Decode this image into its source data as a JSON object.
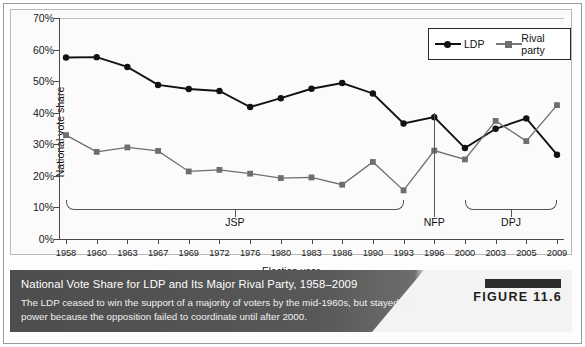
{
  "figure": {
    "badge_label": "FIGURE 11.6",
    "caption_title": "National Vote Share for LDP and Its Major Rival Party, 1958–2009",
    "caption_body": "The LDP ceased to win the support of a majority of voters by the mid-1960s, but stayed in power because the opposition failed to coordinate until after 2000.",
    "accent_dark": "#4d4d4d",
    "accent_light": "#f3f3f3",
    "badge_bar_color": "#2d2d2d"
  },
  "legend": {
    "position": "top-right",
    "items": [
      {
        "label": "LDP",
        "marker": "circle",
        "color": "#121212"
      },
      {
        "label": "Rival party",
        "marker": "square",
        "color": "#6e6e6e"
      }
    ]
  },
  "annotations": [
    {
      "name": "jsp",
      "label": "JSP",
      "type": "bracket",
      "start_year": "1958",
      "end_year": "1993"
    },
    {
      "name": "nfp",
      "label": "NFP",
      "type": "vline",
      "year": "1996"
    },
    {
      "name": "dpj",
      "label": "DPJ",
      "type": "bracket",
      "start_year": "2000",
      "end_year": "2009"
    }
  ],
  "chart_data": {
    "type": "line",
    "title": "National Vote Share for LDP and Its Major Rival Party, 1958–2009",
    "xlabel": "Election year",
    "ylabel": "National vote share",
    "ylim": [
      0,
      70
    ],
    "ytick_labels": [
      "0%",
      "10%",
      "20%",
      "30%",
      "40%",
      "50%",
      "60%",
      "70%"
    ],
    "ytick_values": [
      0,
      10,
      20,
      30,
      40,
      50,
      60,
      70
    ],
    "grid": false,
    "categories": [
      "1958",
      "1960",
      "1963",
      "1967",
      "1969",
      "1972",
      "1976",
      "1980",
      "1983",
      "1986",
      "1990",
      "1993",
      "1996",
      "2000",
      "2003",
      "2005",
      "2009"
    ],
    "series": [
      {
        "name": "LDP",
        "marker": "circle",
        "color": "#121212",
        "values": [
          57.5,
          57.6,
          54.5,
          48.8,
          47.5,
          46.9,
          41.8,
          44.6,
          47.6,
          49.4,
          46.1,
          36.6,
          38.6,
          28.8,
          34.9,
          38.2,
          26.7
        ]
      },
      {
        "name": "Rival party",
        "marker": "square",
        "color": "#6e6e6e",
        "values": [
          32.9,
          27.6,
          29.0,
          27.9,
          21.4,
          21.9,
          20.7,
          19.3,
          19.5,
          17.2,
          24.4,
          15.4,
          28.0,
          25.2,
          37.4,
          31.0,
          42.4
        ]
      }
    ]
  }
}
